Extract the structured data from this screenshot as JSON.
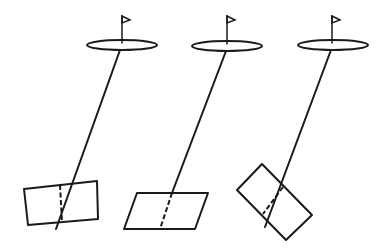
{
  "diagram": {
    "stroke_color": "#1a1a1a",
    "background": "#ffffff",
    "panels": [
      {
        "id": "left",
        "hole": {
          "cx": 122,
          "cy": 45,
          "rx": 35,
          "ry": 5
        },
        "pole": {
          "x": 122,
          "y1": 16,
          "y2": 43
        },
        "flag": "122,16 130,20 122,23",
        "target_line": {
          "x1": 120,
          "y1": 50,
          "x2": 56,
          "y2": 229
        },
        "box": "24,189 97,181 98,219 28,225",
        "divider": {
          "x1": 60,
          "y1": 185,
          "x2": 62,
          "y2": 222
        }
      },
      {
        "id": "middle",
        "hole": {
          "cx": 227,
          "cy": 46,
          "rx": 35,
          "ry": 5
        },
        "pole": {
          "x": 227,
          "y1": 16,
          "y2": 44
        },
        "flag": "227,16 235,20 227,23",
        "target_line": {
          "x1": 226,
          "y1": 51,
          "x2": 172,
          "y2": 193
        },
        "box": "137,193 208,193 195,229 124,229",
        "divider": {
          "x1": 172,
          "y1": 193,
          "x2": 160,
          "y2": 229
        }
      },
      {
        "id": "right",
        "hole": {
          "cx": 333,
          "cy": 45,
          "rx": 35,
          "ry": 5
        },
        "pole": {
          "x": 332,
          "y1": 16,
          "y2": 43
        },
        "flag": "332,16 340,20 332,23",
        "target_line": {
          "x1": 331,
          "y1": 50,
          "x2": 265,
          "y2": 227
        },
        "box": "262,164 237,190 286,240 312,215",
        "divider": {
          "x1": 283,
          "y1": 187,
          "x2": 263,
          "y2": 214
        }
      }
    ]
  }
}
